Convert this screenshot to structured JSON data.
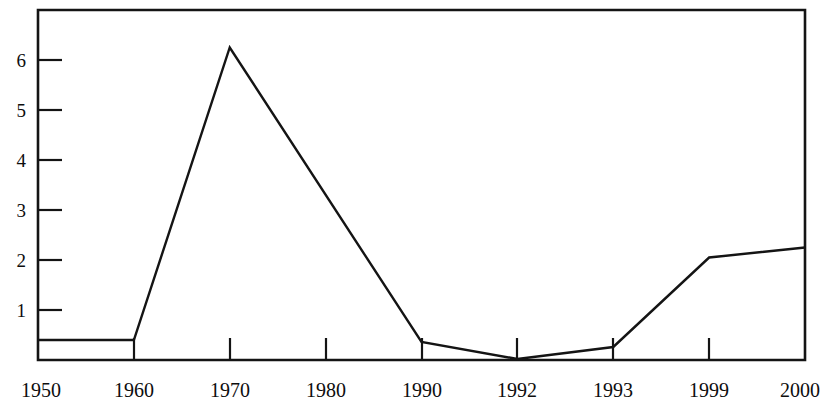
{
  "chart_data": {
    "type": "line",
    "title": "",
    "subtitle": "",
    "xlabel": "",
    "ylabel": "",
    "categories": [
      "1950",
      "1960",
      "1970",
      "1980",
      "1990",
      "1992",
      "1993",
      "1999",
      "2000"
    ],
    "values": [
      0.4,
      0.4,
      6.25,
      3.28,
      0.36,
      0.02,
      0.26,
      2.05,
      2.25
    ],
    "series": [
      {
        "name": "",
        "values": [
          0.4,
          0.4,
          6.25,
          3.28,
          0.36,
          0.02,
          0.26,
          2.05,
          2.25
        ]
      }
    ],
    "ylim": [
      0,
      7
    ],
    "xlim": [
      0,
      8
    ],
    "y_ticks": [
      1,
      2,
      3,
      4,
      5,
      6
    ],
    "y_tick_labels": [
      "1",
      "2",
      "3",
      "4",
      "5",
      "6"
    ],
    "x_tick_labels": [
      "1950",
      "1960",
      "1970",
      "1980",
      "1990",
      "1992",
      "1993",
      "1999",
      "2000"
    ],
    "grid": false,
    "legend": false,
    "legend_position": "none",
    "line_color": "#141414",
    "frame_color": "#141414",
    "background_color": "#ffffff",
    "annotations": []
  },
  "geometry": {
    "plot_left": 38,
    "plot_right": 805,
    "plot_top": 10,
    "plot_bottom": 360,
    "pixels_per_unit_y": 50,
    "pixels_per_category_x": 95.875
  }
}
